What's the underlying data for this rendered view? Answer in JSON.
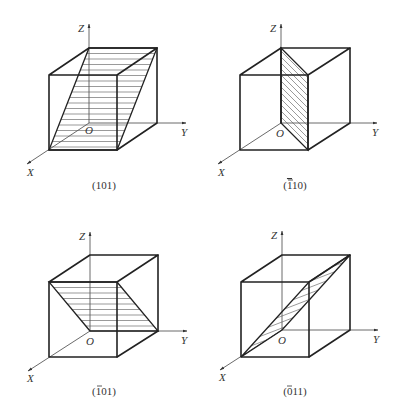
{
  "figure": {
    "axis_labels": {
      "x": "X",
      "y": "Y",
      "z": "Z",
      "origin": "O"
    },
    "panels": [
      {
        "id": "p1",
        "caption": "(101)",
        "caption_parts": {
          "pre": "(",
          "bar": "",
          "rest": "101)"
        },
        "hatch": "horizontal"
      },
      {
        "id": "p2",
        "caption": "(1̄10)",
        "caption_parts": {
          "pre": "(",
          "bar": "1",
          "rest": "10)"
        },
        "hatch": "diagonal"
      },
      {
        "id": "p3",
        "caption": "(1̄01)",
        "caption_parts": {
          "pre": "(",
          "bar": "1",
          "rest": "01)"
        },
        "hatch": "horizontal"
      },
      {
        "id": "p4",
        "caption": "(0̄11)",
        "caption_parts": {
          "pre": "(",
          "bar": "0",
          "rest": "11)"
        },
        "hatch": "diagonal"
      }
    ]
  }
}
